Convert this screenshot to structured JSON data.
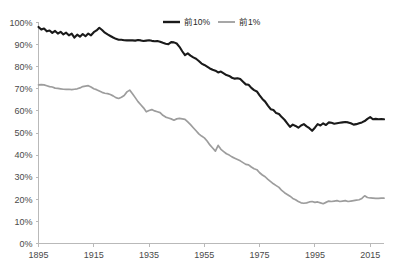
{
  "chart_data": {
    "type": "line",
    "title": "",
    "subtitle": "",
    "xlabel": "",
    "ylabel": "",
    "xlim": [
      1895,
      2020
    ],
    "ylim": [
      0,
      100
    ],
    "grid": false,
    "legend_position": "top-center",
    "x_tick_labels": [
      "1895",
      "1915",
      "1935",
      "1955",
      "1975",
      "1995",
      "2015"
    ],
    "x_ticks": [
      1895,
      1915,
      1935,
      1955,
      1975,
      1995,
      2015
    ],
    "y_tick_labels": [
      "0%",
      "10%",
      "20%",
      "30%",
      "40%",
      "50%",
      "60%",
      "70%",
      "80%",
      "90%",
      "100%"
    ],
    "y_ticks": [
      0,
      10,
      20,
      30,
      40,
      50,
      60,
      70,
      80,
      90,
      100
    ],
    "x": [
      1895,
      1896,
      1897,
      1898,
      1899,
      1900,
      1901,
      1902,
      1903,
      1904,
      1905,
      1906,
      1907,
      1908,
      1909,
      1910,
      1911,
      1912,
      1913,
      1914,
      1915,
      1916,
      1917,
      1918,
      1919,
      1920,
      1921,
      1922,
      1923,
      1924,
      1925,
      1926,
      1927,
      1928,
      1929,
      1930,
      1931,
      1932,
      1933,
      1934,
      1935,
      1936,
      1937,
      1938,
      1939,
      1940,
      1941,
      1942,
      1943,
      1944,
      1945,
      1946,
      1947,
      1948,
      1949,
      1950,
      1951,
      1952,
      1953,
      1954,
      1955,
      1956,
      1957,
      1958,
      1959,
      1960,
      1961,
      1962,
      1963,
      1964,
      1965,
      1966,
      1967,
      1968,
      1969,
      1970,
      1971,
      1972,
      1973,
      1974,
      1975,
      1976,
      1977,
      1978,
      1979,
      1980,
      1981,
      1982,
      1983,
      1984,
      1985,
      1986,
      1987,
      1988,
      1989,
      1990,
      1991,
      1992,
      1993,
      1994,
      1995,
      1996,
      1997,
      1998,
      1999,
      2000,
      2001,
      2002,
      2003,
      2004,
      2005,
      2006,
      2007,
      2008,
      2009,
      2010,
      2011,
      2012,
      2013,
      2014,
      2015,
      2016,
      2017,
      2018,
      2019,
      2020
    ],
    "series": [
      {
        "name": "前10%",
        "color": "#1a1a1a",
        "width": 2.1,
        "values": [
          98.0,
          96.8,
          97.3,
          96.0,
          96.4,
          95.3,
          96.2,
          95.0,
          95.8,
          94.6,
          95.4,
          94.2,
          95.0,
          93.2,
          94.5,
          93.6,
          94.8,
          93.8,
          95.0,
          94.2,
          95.6,
          96.4,
          97.6,
          96.6,
          95.4,
          94.6,
          93.9,
          93.2,
          92.6,
          92.2,
          92.2,
          92.0,
          91.9,
          92.0,
          91.9,
          91.8,
          92.1,
          91.9,
          91.6,
          91.8,
          92.0,
          91.7,
          91.5,
          91.6,
          91.3,
          90.8,
          90.4,
          90.2,
          91.1,
          91.0,
          90.5,
          89.0,
          87.0,
          85.2,
          86.0,
          85.0,
          84.2,
          83.6,
          82.6,
          81.4,
          80.8,
          80.0,
          79.2,
          78.6,
          78.2,
          77.4,
          77.8,
          77.0,
          76.2,
          75.8,
          75.0,
          74.6,
          74.8,
          74.4,
          73.2,
          72.0,
          71.8,
          70.4,
          69.4,
          68.8,
          67.0,
          65.4,
          64.2,
          62.4,
          60.8,
          60.4,
          59.0,
          58.6,
          57.2,
          56.0,
          54.4,
          52.8,
          53.8,
          53.2,
          52.4,
          53.4,
          54.0,
          53.0,
          52.2,
          51.0,
          52.4,
          54.0,
          53.4,
          54.4,
          53.6,
          54.8,
          54.6,
          54.2,
          54.4,
          54.6,
          54.8,
          55.0,
          54.8,
          54.4,
          53.8,
          54.0,
          54.4,
          54.8,
          55.4,
          56.4,
          57.2,
          56.2,
          56.4,
          56.2,
          56.3,
          56.2
        ]
      },
      {
        "name": "前1%",
        "color": "#9d9d9d",
        "width": 1.7,
        "values": [
          71.8,
          71.9,
          71.8,
          71.4,
          71.0,
          70.8,
          70.3,
          70.2,
          70.0,
          69.8,
          69.7,
          69.8,
          69.6,
          69.8,
          70.0,
          70.4,
          71.0,
          71.2,
          71.4,
          70.8,
          70.0,
          69.6,
          69.0,
          68.4,
          68.0,
          67.8,
          67.4,
          66.8,
          66.0,
          65.6,
          66.2,
          67.0,
          68.6,
          69.4,
          67.8,
          66.0,
          64.2,
          62.8,
          61.4,
          59.6,
          60.2,
          60.6,
          60.0,
          59.6,
          59.2,
          58.0,
          57.2,
          56.8,
          56.4,
          55.8,
          56.4,
          56.6,
          56.4,
          56.2,
          55.0,
          53.8,
          52.4,
          51.0,
          49.6,
          48.6,
          47.8,
          46.4,
          44.6,
          43.2,
          41.8,
          44.4,
          42.6,
          41.6,
          40.6,
          40.0,
          39.2,
          38.6,
          38.0,
          37.4,
          36.6,
          35.8,
          35.6,
          34.6,
          33.8,
          33.4,
          32.0,
          31.0,
          30.2,
          29.0,
          28.0,
          27.0,
          26.2,
          25.4,
          24.0,
          23.0,
          22.2,
          21.4,
          20.4,
          19.8,
          19.0,
          18.4,
          18.2,
          18.4,
          18.8,
          19.0,
          18.6,
          18.8,
          18.4,
          18.0,
          18.6,
          19.2,
          19.0,
          19.2,
          19.4,
          19.0,
          19.2,
          19.4,
          19.0,
          19.2,
          19.4,
          19.6,
          19.8,
          20.4,
          21.6,
          20.8,
          20.6,
          20.5,
          20.4,
          20.4,
          20.5,
          20.5
        ]
      }
    ]
  },
  "legend": {
    "items": [
      {
        "label": "前10%",
        "color": "#1a1a1a"
      },
      {
        "label": "前1%",
        "color": "#9d9d9d"
      }
    ]
  },
  "axes": {
    "y_labels": [
      "100%",
      "90%",
      "80%",
      "70%",
      "60%",
      "50%",
      "40%",
      "30%",
      "20%",
      "10%",
      "0%"
    ],
    "x_labels": [
      "1895",
      "1915",
      "1935",
      "1955",
      "1975",
      "1995",
      "2015"
    ]
  }
}
